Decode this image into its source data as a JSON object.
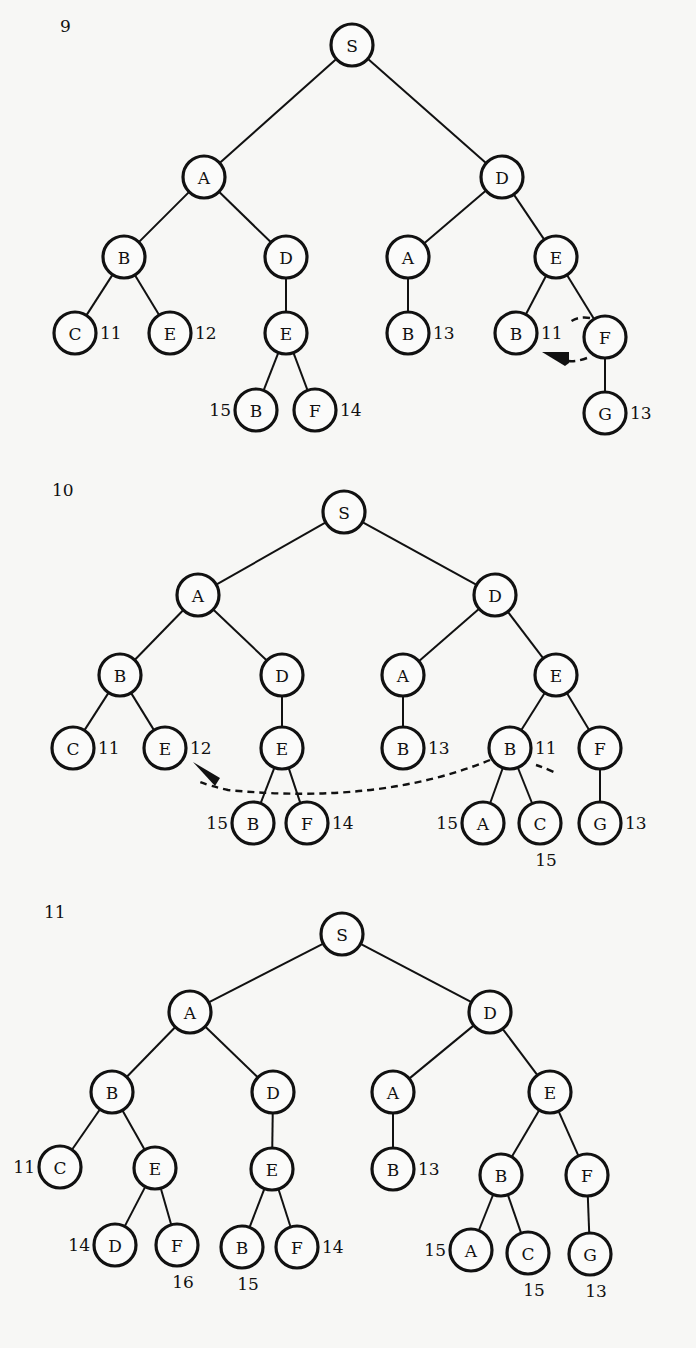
{
  "diagrams": [
    {
      "id": "9",
      "label": "9",
      "label_pos": [
        60,
        28
      ],
      "nodes": [
        {
          "id": "s",
          "label": "S",
          "x": 352,
          "y": 45
        },
        {
          "id": "a",
          "label": "A",
          "x": 204,
          "y": 177
        },
        {
          "id": "d",
          "label": "D",
          "x": 502,
          "y": 177
        },
        {
          "id": "ab",
          "label": "B",
          "x": 124,
          "y": 257
        },
        {
          "id": "ad",
          "label": "D",
          "x": 286,
          "y": 257
        },
        {
          "id": "da",
          "label": "A",
          "x": 408,
          "y": 257
        },
        {
          "id": "de",
          "label": "E",
          "x": 556,
          "y": 257
        },
        {
          "id": "abc",
          "label": "C",
          "x": 75,
          "y": 333,
          "cost": "11",
          "cost_side": "right"
        },
        {
          "id": "abe",
          "label": "E",
          "x": 170,
          "y": 333,
          "cost": "12",
          "cost_side": "right"
        },
        {
          "id": "ade",
          "label": "E",
          "x": 286,
          "y": 333
        },
        {
          "id": "dab",
          "label": "B",
          "x": 408,
          "y": 333,
          "cost": "13",
          "cost_side": "right"
        },
        {
          "id": "deb",
          "label": "B",
          "x": 516,
          "y": 333,
          "cost": "11",
          "cost_side": "right"
        },
        {
          "id": "def",
          "label": "F",
          "x": 605,
          "y": 337
        },
        {
          "id": "adeb",
          "label": "B",
          "x": 256,
          "y": 410,
          "cost": "15",
          "cost_side": "left"
        },
        {
          "id": "adef",
          "label": "F",
          "x": 315,
          "y": 410,
          "cost": "14",
          "cost_side": "right"
        },
        {
          "id": "defg",
          "label": "G",
          "x": 605,
          "y": 413,
          "cost": "13",
          "cost_side": "right"
        }
      ],
      "edges": [
        [
          "s",
          "a"
        ],
        [
          "s",
          "d"
        ],
        [
          "a",
          "ab"
        ],
        [
          "a",
          "ad"
        ],
        [
          "d",
          "da"
        ],
        [
          "d",
          "de"
        ],
        [
          "ab",
          "abc"
        ],
        [
          "ab",
          "abe"
        ],
        [
          "ad",
          "ade"
        ],
        [
          "da",
          "dab"
        ],
        [
          "de",
          "deb"
        ],
        [
          "de",
          "def"
        ],
        [
          "ade",
          "adeb"
        ],
        [
          "ade",
          "adef"
        ],
        [
          "def",
          "defg"
        ]
      ],
      "annotation": "dashed arc with arrowhead from F pointing back to B (11)"
    },
    {
      "id": "10",
      "label": "10",
      "label_pos": [
        52,
        492
      ],
      "nodes": [
        {
          "id": "s",
          "label": "S",
          "x": 344,
          "y": 512
        },
        {
          "id": "a",
          "label": "A",
          "x": 198,
          "y": 595
        },
        {
          "id": "d",
          "label": "D",
          "x": 495,
          "y": 595
        },
        {
          "id": "ab",
          "label": "B",
          "x": 120,
          "y": 675
        },
        {
          "id": "ad",
          "label": "D",
          "x": 282,
          "y": 675
        },
        {
          "id": "da",
          "label": "A",
          "x": 403,
          "y": 675
        },
        {
          "id": "de",
          "label": "E",
          "x": 556,
          "y": 675
        },
        {
          "id": "abc",
          "label": "C",
          "x": 73,
          "y": 748,
          "cost": "11",
          "cost_side": "right"
        },
        {
          "id": "abe",
          "label": "E",
          "x": 165,
          "y": 748,
          "cost": "12",
          "cost_side": "right"
        },
        {
          "id": "ade",
          "label": "E",
          "x": 282,
          "y": 748
        },
        {
          "id": "dab",
          "label": "B",
          "x": 403,
          "y": 748,
          "cost": "13",
          "cost_side": "right"
        },
        {
          "id": "deb",
          "label": "B",
          "x": 510,
          "y": 748,
          "cost": "11",
          "cost_side": "right"
        },
        {
          "id": "def",
          "label": "F",
          "x": 600,
          "y": 748
        },
        {
          "id": "adeb",
          "label": "B",
          "x": 253,
          "y": 823,
          "cost": "15",
          "cost_side": "left"
        },
        {
          "id": "adef",
          "label": "F",
          "x": 307,
          "y": 823,
          "cost": "14",
          "cost_side": "right"
        },
        {
          "id": "deba",
          "label": "A",
          "x": 483,
          "y": 823,
          "cost": "15",
          "cost_side": "left"
        },
        {
          "id": "debc",
          "label": "C",
          "x": 540,
          "y": 823,
          "cost": "15",
          "cost_side": "below"
        },
        {
          "id": "defg",
          "label": "G",
          "x": 600,
          "y": 823,
          "cost": "13",
          "cost_side": "right"
        }
      ],
      "edges": [
        [
          "s",
          "a"
        ],
        [
          "s",
          "d"
        ],
        [
          "a",
          "ab"
        ],
        [
          "a",
          "ad"
        ],
        [
          "d",
          "da"
        ],
        [
          "d",
          "de"
        ],
        [
          "ab",
          "abc"
        ],
        [
          "ab",
          "abe"
        ],
        [
          "ad",
          "ade"
        ],
        [
          "da",
          "dab"
        ],
        [
          "de",
          "deb"
        ],
        [
          "de",
          "def"
        ],
        [
          "ade",
          "adeb"
        ],
        [
          "ade",
          "adef"
        ],
        [
          "deb",
          "deba"
        ],
        [
          "deb",
          "debc"
        ],
        [
          "def",
          "defg"
        ]
      ],
      "annotation": "long dashed arc with arrowhead from B (11) back to E (12)"
    },
    {
      "id": "11",
      "label": "11",
      "label_pos": [
        44,
        914
      ],
      "nodes": [
        {
          "id": "s",
          "label": "S",
          "x": 342,
          "y": 934
        },
        {
          "id": "a",
          "label": "A",
          "x": 190,
          "y": 1012
        },
        {
          "id": "d",
          "label": "D",
          "x": 490,
          "y": 1012
        },
        {
          "id": "ab",
          "label": "B",
          "x": 112,
          "y": 1092
        },
        {
          "id": "ad",
          "label": "D",
          "x": 273,
          "y": 1092
        },
        {
          "id": "da",
          "label": "A",
          "x": 393,
          "y": 1092
        },
        {
          "id": "de",
          "label": "E",
          "x": 550,
          "y": 1092
        },
        {
          "id": "abc",
          "label": "C",
          "x": 60,
          "y": 1167,
          "cost": "11",
          "cost_side": "left"
        },
        {
          "id": "abe",
          "label": "E",
          "x": 155,
          "y": 1168
        },
        {
          "id": "ade",
          "label": "E",
          "x": 272,
          "y": 1169
        },
        {
          "id": "dab",
          "label": "B",
          "x": 393,
          "y": 1169,
          "cost": "13",
          "cost_side": "right"
        },
        {
          "id": "deb",
          "label": "B",
          "x": 501,
          "y": 1175
        },
        {
          "id": "def",
          "label": "F",
          "x": 587,
          "y": 1175
        },
        {
          "id": "abed",
          "label": "D",
          "x": 115,
          "y": 1245,
          "cost": "14",
          "cost_side": "left"
        },
        {
          "id": "abef",
          "label": "F",
          "x": 177,
          "y": 1245,
          "cost": "16",
          "cost_side": "below"
        },
        {
          "id": "adeb",
          "label": "B",
          "x": 242,
          "y": 1247,
          "cost": "15",
          "cost_side": "below"
        },
        {
          "id": "adef",
          "label": "F",
          "x": 297,
          "y": 1247,
          "cost": "14",
          "cost_side": "right"
        },
        {
          "id": "deba",
          "label": "A",
          "x": 471,
          "y": 1250,
          "cost": "15",
          "cost_side": "left"
        },
        {
          "id": "debc",
          "label": "C",
          "x": 528,
          "y": 1253,
          "cost": "15",
          "cost_side": "below"
        },
        {
          "id": "defg",
          "label": "G",
          "x": 590,
          "y": 1254,
          "cost": "13",
          "cost_side": "below"
        }
      ],
      "edges": [
        [
          "s",
          "a"
        ],
        [
          "s",
          "d"
        ],
        [
          "a",
          "ab"
        ],
        [
          "a",
          "ad"
        ],
        [
          "d",
          "da"
        ],
        [
          "d",
          "de"
        ],
        [
          "ab",
          "abc"
        ],
        [
          "ab",
          "abe"
        ],
        [
          "ad",
          "ade"
        ],
        [
          "da",
          "dab"
        ],
        [
          "de",
          "deb"
        ],
        [
          "de",
          "def"
        ],
        [
          "abe",
          "abed"
        ],
        [
          "abe",
          "abef"
        ],
        [
          "ade",
          "adeb"
        ],
        [
          "ade",
          "adef"
        ],
        [
          "deb",
          "deba"
        ],
        [
          "deb",
          "debc"
        ],
        [
          "def",
          "defg"
        ]
      ]
    }
  ]
}
